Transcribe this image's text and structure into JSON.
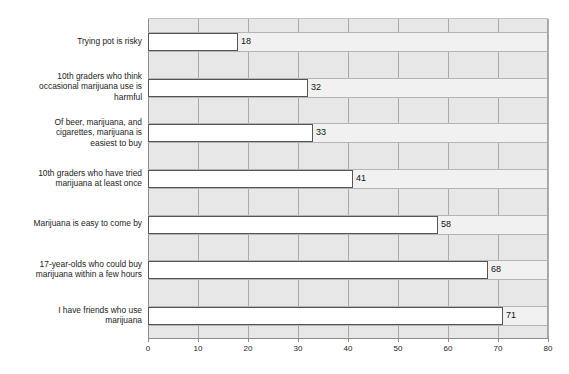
{
  "chart_data": {
    "type": "bar",
    "orientation": "horizontal",
    "title": "",
    "xlabel": "",
    "ylabel": "",
    "xlim": [
      0,
      80
    ],
    "xticks": [
      "0",
      "10",
      "20",
      "30",
      "40",
      "50",
      "60",
      "70",
      "80"
    ],
    "grid": true,
    "legend": false,
    "categories": [
      "Trying pot is risky",
      "10th graders who think occasional marijuana use is harmful",
      "Of beer, marijuana, and cigarettes, marijuana is easiest to buy",
      "10th graders who have tried marijuana at least once",
      "Marijuana is easy to come by",
      "17-year-olds who could buy marijuana within a few hours",
      "I have friends who use marijuana"
    ],
    "category_lines": [
      [
        "Trying pot is risky"
      ],
      [
        "10th graders who think",
        "occasional marijuana use is",
        "harmful"
      ],
      [
        "Of beer, marijuana, and",
        "cigarettes, marijuana is",
        "easiest to buy"
      ],
      [
        "10th graders who have tried",
        "marijuana at least once"
      ],
      [
        "Marijuana is easy to come by"
      ],
      [
        "17-year-olds who could buy",
        "marijuana within a few hours"
      ],
      [
        "I have friends who use",
        "marijuana"
      ]
    ],
    "values": [
      18,
      32,
      33,
      41,
      58,
      68,
      71
    ],
    "value_labels": [
      "18",
      "32",
      "33",
      "41",
      "58",
      "68",
      "71"
    ]
  },
  "style": {
    "plot_background": "#e7e7e7",
    "row_band": "#f1f1f1",
    "bar_fill": "#ffffff",
    "bar_border": "#555555",
    "gridline": "#aaaaaa",
    "axis": "#8d8d8d",
    "text": "#1c1c1c"
  }
}
